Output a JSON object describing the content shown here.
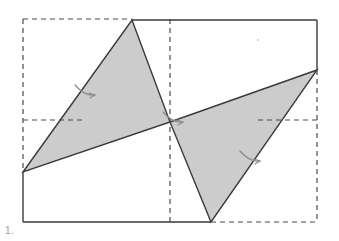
{
  "figure": {
    "label": "1.",
    "caption_color": "#9a9a9a",
    "background": "#ffffff",
    "width": 339,
    "height": 241
  },
  "style": {
    "shaded_fill": "#cccccc",
    "solid_stroke": "#3a3a3a",
    "dashed_stroke": "#4a4a4a",
    "mark_stroke": "#8c8c8c",
    "solid_width": 1.4,
    "dashed_width": 1.2,
    "dash_pattern": "5 4"
  },
  "chart_data": {
    "type": "diagram",
    "bounding_box": {
      "name": "dashed-bounding-rectangle",
      "left": 23,
      "top": 19,
      "right": 317,
      "bottom": 222
    },
    "centre_point": {
      "name": "rotation-centre",
      "x": 170,
      "y": 122
    },
    "shapes": [
      {
        "name": "left-triangle",
        "fill": "#cccccc",
        "points": [
          [
            132,
            20
          ],
          [
            170,
            122
          ],
          [
            23,
            172
          ]
        ]
      },
      {
        "name": "right-triangle",
        "fill": "#cccccc",
        "points": [
          [
            170,
            122
          ],
          [
            317,
            70
          ],
          [
            211,
            222
          ]
        ]
      }
    ],
    "solid_paths": [
      {
        "name": "top-solid-edge",
        "points": [
          [
            132,
            20
          ],
          [
            317,
            20
          ]
        ]
      },
      {
        "name": "right-solid-edge",
        "points": [
          [
            317,
            20
          ],
          [
            317,
            70
          ]
        ]
      },
      {
        "name": "left-solid-edge",
        "points": [
          [
            23,
            172
          ],
          [
            23,
            222
          ]
        ]
      },
      {
        "name": "bottom-solid-edge",
        "points": [
          [
            23,
            222
          ],
          [
            211,
            222
          ]
        ]
      }
    ],
    "dashed_paths": [
      {
        "name": "dashed-top-left",
        "points": [
          [
            23,
            19
          ],
          [
            132,
            19
          ]
        ]
      },
      {
        "name": "dashed-left-upper",
        "points": [
          [
            23,
            19
          ],
          [
            23,
            172
          ]
        ]
      },
      {
        "name": "dashed-right-lower",
        "points": [
          [
            317,
            70
          ],
          [
            317,
            222
          ]
        ]
      },
      {
        "name": "dashed-bottom-right",
        "points": [
          [
            211,
            222
          ],
          [
            317,
            222
          ]
        ]
      },
      {
        "name": "dashed-midline-vertical",
        "points": [
          [
            170,
            19
          ],
          [
            170,
            222
          ]
        ]
      },
      {
        "name": "dashed-midline-left",
        "points": [
          [
            23,
            120
          ],
          [
            82,
            120
          ]
        ]
      },
      {
        "name": "dashed-midline-right",
        "points": [
          [
            258,
            120
          ],
          [
            317,
            120
          ]
        ]
      }
    ],
    "tick_marks": [
      {
        "name": "tick-left-hypotenuse",
        "x": 84,
        "y": 92
      },
      {
        "name": "tick-right-hypotenuse",
        "x": 249,
        "y": 158
      },
      {
        "name": "tick-centre",
        "x": 172,
        "y": 119
      }
    ],
    "specks": [
      {
        "name": "stray-speck",
        "x": 258,
        "y": 40
      }
    ]
  }
}
